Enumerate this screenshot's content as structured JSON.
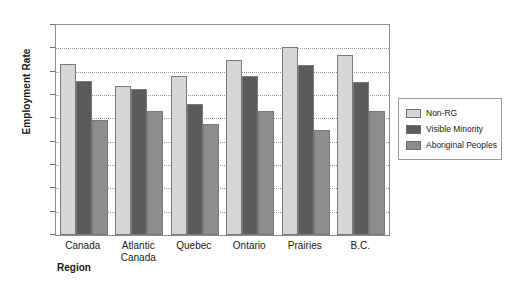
{
  "chart_data": {
    "type": "bar",
    "title": "",
    "xlabel": "Region",
    "ylabel": "Employment Rate",
    "categories": [
      "Canada",
      "Atlantic\nCanada",
      "Quebec",
      "Ontario",
      "Prairies",
      "B.C."
    ],
    "series": [
      {
        "name": "Non-RG",
        "color": "#d6d6d6",
        "values": [
          73.5,
          64.0,
          68.0,
          75.0,
          80.5,
          77.0
        ]
      },
      {
        "name": "Visible Minority",
        "color": "#5b5b5b",
        "values": [
          66.0,
          62.5,
          56.0,
          68.0,
          73.0,
          65.5
        ]
      },
      {
        "name": "Aboriginal Peoples",
        "color": "#8d8d8d",
        "values": [
          49.5,
          53.0,
          47.5,
          53.0,
          45.0,
          53.0
        ]
      }
    ],
    "ylim": [
      0,
      90
    ],
    "yticks": [
      0,
      10,
      20,
      30,
      40,
      50,
      60,
      70,
      80,
      90
    ],
    "grid": true,
    "legend_position": "right"
  }
}
